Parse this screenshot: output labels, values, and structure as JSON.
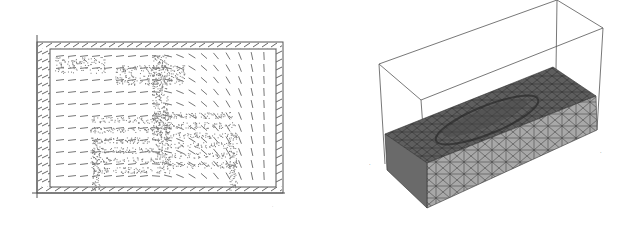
{
  "figure": {
    "panels": [
      {
        "id": "left",
        "description": "2D vector field over chest x-ray point cloud (ribcage)",
        "axis_marks": [
          "",
          ""
        ]
      },
      {
        "id": "right",
        "description": "3D tetrahedral mesh block with surface deformation inside bounding box",
        "axis_marks": [
          "",
          "",
          ""
        ]
      }
    ],
    "colors": {
      "line": "#555555",
      "mesh_top": "#5a5a5a",
      "mesh_side": "#9a9a9a",
      "points": "#7a7a7a"
    }
  }
}
